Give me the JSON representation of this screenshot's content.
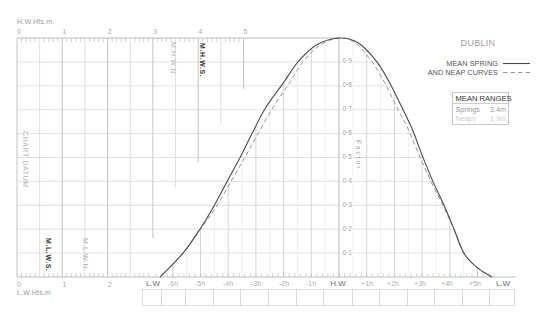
{
  "title": "DUBLIN",
  "legend": {
    "spring_label": "MEAN SPRING",
    "neap_label": "AND NEAP CURVES"
  },
  "mean_ranges": {
    "title": "MEAN RANGES",
    "rows": [
      {
        "label": "Springs",
        "value": "3.4m"
      },
      {
        "label": "Neaps",
        "value": "1.9m"
      }
    ]
  },
  "height_scale": {
    "top_label": "H.W.Hts.m.",
    "top_ticks": [
      "0",
      "1",
      "2",
      "3",
      "4",
      "5"
    ],
    "bottom_label": "L.W.Hts.m",
    "bottom_ticks": [
      "0",
      "1",
      "2"
    ]
  },
  "levels": {
    "chart_datum": "CHART DATUM",
    "mhwn": "M.H.W.N.",
    "mhws": "M.H.W.S.",
    "mlws": "M.L.W.S.",
    "mlwn": "M.L.W.N."
  },
  "factor": {
    "label": "Factor",
    "ticks": [
      "0·9",
      "0·8",
      "0·7",
      "0·6",
      "0·5",
      "0·4",
      "0·3",
      "0·2",
      "0·1"
    ]
  },
  "time_axis": {
    "labels": [
      "L.W",
      "-6h",
      "-5h",
      "-4h",
      "-3h",
      "-2h",
      "-1h",
      "H.W",
      "+1h",
      "+2h",
      "+3h",
      "+4h",
      "+5h",
      "L.W"
    ]
  },
  "colors": {
    "curve": "#4a4a4a",
    "neap_curve": "#8a8a8a",
    "grid": "#d6d6d6",
    "ruler": "#b4b4b4"
  },
  "chart_data": {
    "type": "line",
    "title": "DUBLIN",
    "xlabel": "Time relative to H.W (hours)",
    "ylabel": "Factor",
    "xlim": [
      -6.5,
      5.6
    ],
    "ylim": [
      0,
      1
    ],
    "x_tick_labels": [
      "L.W",
      "-6h",
      "-5h",
      "-4h",
      "-3h",
      "-2h",
      "-1h",
      "H.W",
      "+1h",
      "+2h",
      "+3h",
      "+4h",
      "+5h",
      "L.W"
    ],
    "y_tick_labels": [
      "0.1",
      "0.2",
      "0.3",
      "0.4",
      "0.5",
      "0.6",
      "0.7",
      "0.8",
      "0.9"
    ],
    "grid": true,
    "legend": [
      {
        "name": "Mean Spring",
        "style": "solid"
      },
      {
        "name": "Mean Neap",
        "style": "dashed"
      }
    ],
    "height_axis_m": {
      "hw_range": [
        0,
        5
      ],
      "lw_range": [
        0,
        3
      ]
    },
    "mean_ranges_m": {
      "springs": 3.4,
      "neaps": 1.9
    },
    "series": [
      {
        "name": "Mean Spring",
        "style": "solid",
        "points": [
          [
            -6.46,
            0.0
          ],
          [
            -5.63,
            0.1
          ],
          [
            -5.02,
            0.2
          ],
          [
            -4.55,
            0.29
          ],
          [
            -4.04,
            0.4
          ],
          [
            -3.57,
            0.5
          ],
          [
            -3.14,
            0.6
          ],
          [
            -2.64,
            0.71
          ],
          [
            -2.02,
            0.81
          ],
          [
            -1.48,
            0.9
          ],
          [
            -0.83,
            0.97
          ],
          [
            0.0,
            1.0
          ],
          [
            0.69,
            0.98
          ],
          [
            1.37,
            0.9
          ],
          [
            1.84,
            0.81
          ],
          [
            2.27,
            0.71
          ],
          [
            2.64,
            0.62
          ],
          [
            3.0,
            0.51
          ],
          [
            3.39,
            0.4
          ],
          [
            3.83,
            0.29
          ],
          [
            4.15,
            0.2
          ],
          [
            4.51,
            0.1
          ],
          [
            4.98,
            0.04
          ],
          [
            5.52,
            0.0
          ]
        ]
      },
      {
        "name": "Mean Neap",
        "style": "dashed",
        "points": [
          [
            -6.46,
            0.0
          ],
          [
            -5.63,
            0.1
          ],
          [
            -5.0,
            0.2
          ],
          [
            -4.45,
            0.29
          ],
          [
            -3.9,
            0.4
          ],
          [
            -3.4,
            0.5
          ],
          [
            -2.92,
            0.6
          ],
          [
            -2.38,
            0.71
          ],
          [
            -1.8,
            0.81
          ],
          [
            -1.3,
            0.9
          ],
          [
            -0.69,
            0.97
          ],
          [
            0.0,
            1.0
          ],
          [
            0.58,
            0.98
          ],
          [
            1.19,
            0.9
          ],
          [
            1.66,
            0.81
          ],
          [
            2.09,
            0.71
          ],
          [
            2.49,
            0.62
          ],
          [
            2.89,
            0.51
          ],
          [
            3.32,
            0.4
          ],
          [
            3.79,
            0.29
          ],
          [
            4.15,
            0.2
          ],
          [
            4.51,
            0.1
          ],
          [
            4.98,
            0.04
          ],
          [
            5.52,
            0.0
          ]
        ]
      }
    ]
  }
}
